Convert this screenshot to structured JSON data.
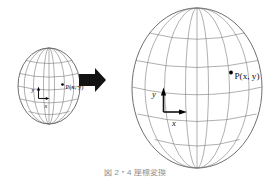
{
  "figure": {
    "background_color": "#ffffff",
    "caption": "図 2・4  座標変換",
    "arrow": {
      "name": "transform-arrow",
      "direction": "right",
      "color": "#131313"
    },
    "small_globe": {
      "label": "small-sphere",
      "center_x": 49,
      "center_y": 86,
      "radius_x": 31,
      "radius_y": 38,
      "point_label": "P(x, y)",
      "point_prefix": "P",
      "point_coords": "(x, y)",
      "x_axis_label": "x",
      "y_axis_label": "y",
      "meridian_count": 5,
      "parallel_count": 5,
      "outline_color": "#4a4a4a",
      "grid_color": "#6e6e6e"
    },
    "large_globe": {
      "label": "large-sphere",
      "center_x": 197,
      "center_y": 88,
      "radius_x": 65,
      "radius_y": 80,
      "point_label": "P(x, y)",
      "point_prefix": "P",
      "point_coords": "(x, y)",
      "x_axis_label": "x",
      "y_axis_label": "y",
      "meridian_count": 5,
      "parallel_count": 5,
      "outline_color": "#555555",
      "grid_color": "#7a7a7a"
    }
  }
}
